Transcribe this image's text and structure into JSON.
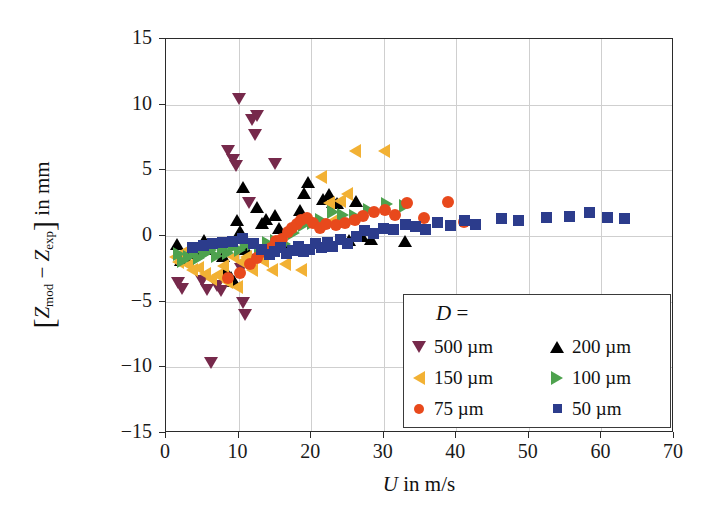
{
  "chart_data": {
    "type": "scatter",
    "title": "",
    "xlabel": "U in m/s",
    "ylabel": "[Z_mod - Z_exp] in mm",
    "xlim": [
      0,
      70
    ],
    "ylim": [
      -15,
      15
    ],
    "xticks": [
      0,
      10,
      20,
      30,
      40,
      50,
      60,
      70
    ],
    "yticks": [
      -15,
      -10,
      -5,
      0,
      5,
      10,
      15
    ],
    "grid": true,
    "legend_position": "lower-right",
    "legend_title": "D =",
    "series": [
      {
        "name": "500 um",
        "label": "500 µm",
        "marker": "triangle-down",
        "color": "#76294B",
        "points": [
          [
            1.6,
            -3.6
          ],
          [
            2.2,
            -4.0
          ],
          [
            5.0,
            -3.4
          ],
          [
            5.6,
            -4.1
          ],
          [
            6.2,
            -9.7
          ],
          [
            7.0,
            -3.8
          ],
          [
            7.6,
            -4.2
          ],
          [
            8.6,
            6.5
          ],
          [
            9.2,
            5.8
          ],
          [
            9.6,
            5.3
          ],
          [
            10.0,
            10.4
          ],
          [
            10.4,
            -2.5
          ],
          [
            10.6,
            -5.1
          ],
          [
            10.9,
            -6.0
          ],
          [
            11.4,
            2.5
          ],
          [
            11.8,
            8.8
          ],
          [
            12.6,
            9.1
          ],
          [
            12.2,
            7.7
          ],
          [
            15.0,
            5.5
          ]
        ]
      },
      {
        "name": "200 um",
        "label": "200 µm",
        "marker": "triangle-up",
        "color": "#000000",
        "points": [
          [
            1.5,
            -0.6
          ],
          [
            2.0,
            -1.8
          ],
          [
            2.6,
            -1.5
          ],
          [
            3.0,
            -1.3
          ],
          [
            4.2,
            -1.2
          ],
          [
            5.2,
            -0.3
          ],
          [
            5.6,
            -1.0
          ],
          [
            7.8,
            -1.5
          ],
          [
            8.2,
            -2.7
          ],
          [
            9.0,
            -3.1
          ],
          [
            9.4,
            -3.4
          ],
          [
            9.8,
            1.2
          ],
          [
            10.2,
            0.4
          ],
          [
            10.6,
            3.7
          ],
          [
            11.0,
            -1.0
          ],
          [
            12.6,
            2.2
          ],
          [
            13.2,
            1.0
          ],
          [
            13.8,
            1.3
          ],
          [
            15.0,
            1.6
          ],
          [
            15.6,
            0.6
          ],
          [
            16.2,
            -0.6
          ],
          [
            18.4,
            2.0
          ],
          [
            19.0,
            3.3
          ],
          [
            19.6,
            4.1
          ],
          [
            21.6,
            2.8
          ],
          [
            22.4,
            3.2
          ],
          [
            23.0,
            2.6
          ],
          [
            23.6,
            2.5
          ],
          [
            25.2,
            -0.3
          ],
          [
            26.2,
            2.7
          ],
          [
            27.0,
            0.0
          ],
          [
            28.2,
            -0.2
          ],
          [
            33.0,
            -0.4
          ]
        ]
      },
      {
        "name": "150 um",
        "label": "150 µm",
        "marker": "triangle-left",
        "color": "#F2B134",
        "points": [
          [
            1.2,
            -1.6
          ],
          [
            1.6,
            -2.0
          ],
          [
            2.2,
            -1.3
          ],
          [
            3.0,
            -2.2
          ],
          [
            3.6,
            -2.6
          ],
          [
            4.4,
            -2.4
          ],
          [
            5.4,
            -2.9
          ],
          [
            6.2,
            -3.3
          ],
          [
            7.0,
            -3.0
          ],
          [
            7.8,
            -2.3
          ],
          [
            8.4,
            -3.5
          ],
          [
            9.2,
            -1.6
          ],
          [
            9.8,
            -3.9
          ],
          [
            10.4,
            -2.0
          ],
          [
            11.0,
            -1.6
          ],
          [
            11.8,
            -2.6
          ],
          [
            12.6,
            -1.5
          ],
          [
            13.4,
            -1.9
          ],
          [
            14.6,
            -2.6
          ],
          [
            16.4,
            -2.1
          ],
          [
            18.6,
            -2.6
          ],
          [
            21.4,
            4.5
          ],
          [
            22.4,
            2.5
          ],
          [
            23.2,
            1.2
          ],
          [
            24.0,
            2.7
          ],
          [
            25.0,
            3.2
          ],
          [
            26.0,
            6.5
          ],
          [
            30.0,
            6.5
          ]
        ]
      },
      {
        "name": "100 um",
        "label": "100 µm",
        "marker": "triangle-right",
        "color": "#4EA24E",
        "points": [
          [
            1.8,
            -1.4
          ],
          [
            2.4,
            -1.9
          ],
          [
            3.2,
            -1.6
          ],
          [
            4.0,
            -1.2
          ],
          [
            4.6,
            -1.7
          ],
          [
            5.4,
            -1.4
          ],
          [
            6.2,
            -1.1
          ],
          [
            7.0,
            -1.5
          ],
          [
            7.8,
            -1.0
          ],
          [
            8.6,
            -1.3
          ],
          [
            9.4,
            -0.8
          ],
          [
            10.2,
            -1.1
          ],
          [
            11.0,
            -0.7
          ],
          [
            12.0,
            -0.6
          ],
          [
            13.0,
            -0.9
          ],
          [
            14.0,
            -0.5
          ],
          [
            15.2,
            -0.4
          ],
          [
            16.4,
            -0.6
          ],
          [
            17.6,
            0.2
          ],
          [
            19.0,
            0.8
          ],
          [
            20.2,
            1.0
          ],
          [
            21.4,
            1.2
          ],
          [
            23.0,
            1.8
          ],
          [
            24.4,
            1.6
          ],
          [
            26.0,
            1.5
          ],
          [
            28.0,
            2.0
          ],
          [
            30.4,
            2.4
          ],
          [
            33.0,
            2.3
          ]
        ]
      },
      {
        "name": "75 um",
        "label": "75 µm",
        "marker": "circle",
        "color": "#E8491C",
        "points": [
          [
            8.6,
            -3.2
          ],
          [
            10.2,
            -2.8
          ],
          [
            11.6,
            -2.1
          ],
          [
            12.6,
            -1.7
          ],
          [
            13.6,
            -1.2
          ],
          [
            14.4,
            -0.9
          ],
          [
            15.2,
            -0.4
          ],
          [
            16.0,
            -0.2
          ],
          [
            16.8,
            0.3
          ],
          [
            17.4,
            0.6
          ],
          [
            18.0,
            0.9
          ],
          [
            18.6,
            1.2
          ],
          [
            19.4,
            1.4
          ],
          [
            20.2,
            1.0
          ],
          [
            21.2,
            0.6
          ],
          [
            22.0,
            0.9
          ],
          [
            23.4,
            0.8
          ],
          [
            24.6,
            1.0
          ],
          [
            26.0,
            1.2
          ],
          [
            27.2,
            1.5
          ],
          [
            28.6,
            1.8
          ],
          [
            30.2,
            2.0
          ],
          [
            31.6,
            1.6
          ],
          [
            33.2,
            2.5
          ],
          [
            35.6,
            1.4
          ],
          [
            38.8,
            2.6
          ],
          [
            41.0,
            1.1
          ]
        ]
      },
      {
        "name": "50 um",
        "label": "50 µm",
        "marker": "square",
        "color": "#2C3C8C",
        "points": [
          [
            3.6,
            -0.9
          ],
          [
            5.2,
            -0.7
          ],
          [
            6.4,
            -0.6
          ],
          [
            7.8,
            -0.5
          ],
          [
            9.2,
            -0.4
          ],
          [
            10.6,
            -0.2
          ],
          [
            12.0,
            -0.6
          ],
          [
            13.2,
            -1.0
          ],
          [
            14.2,
            -1.4
          ],
          [
            15.0,
            -1.2
          ],
          [
            15.8,
            -0.9
          ],
          [
            16.6,
            -1.3
          ],
          [
            17.4,
            -1.1
          ],
          [
            18.2,
            -0.8
          ],
          [
            19.0,
            -1.2
          ],
          [
            19.8,
            -1.0
          ],
          [
            20.6,
            -0.6
          ],
          [
            21.4,
            -0.9
          ],
          [
            22.2,
            -0.5
          ],
          [
            23.0,
            -0.8
          ],
          [
            24.0,
            -0.3
          ],
          [
            25.0,
            -0.6
          ],
          [
            26.2,
            0.0
          ],
          [
            27.4,
            0.4
          ],
          [
            28.6,
            0.2
          ],
          [
            30.0,
            0.6
          ],
          [
            31.4,
            0.5
          ],
          [
            33.0,
            0.9
          ],
          [
            34.4,
            0.7
          ],
          [
            35.8,
            0.5
          ],
          [
            37.4,
            1.0
          ],
          [
            39.2,
            0.8
          ],
          [
            41.2,
            1.2
          ],
          [
            42.6,
            0.9
          ],
          [
            46.2,
            1.3
          ],
          [
            48.6,
            1.2
          ],
          [
            52.4,
            1.4
          ],
          [
            55.6,
            1.5
          ],
          [
            58.4,
            1.8
          ],
          [
            60.8,
            1.4
          ],
          [
            63.2,
            1.3
          ]
        ]
      }
    ]
  },
  "axes": {
    "x_title_var": "U",
    "x_title_rest": "in m/s",
    "y_title_num": "Z",
    "y_title_num_sub": "mod",
    "y_title_minus": "−",
    "y_title_den": "Z",
    "y_title_den_sub": "exp",
    "y_title_rest": "in mm",
    "xtick_labels": [
      "0",
      "10",
      "20",
      "30",
      "40",
      "50",
      "60",
      "70"
    ],
    "ytick_labels": [
      "15",
      "10",
      "5",
      "0",
      "−5",
      "−10",
      "−15"
    ]
  },
  "legend": {
    "title_var": "D",
    "title_eq": "=",
    "rows": [
      {
        "left": {
          "label": "500 µm",
          "marker": "triangle-down",
          "color": "#76294B"
        },
        "right": {
          "label": "200 µm",
          "marker": "triangle-up",
          "color": "#000000"
        }
      },
      {
        "left": {
          "label": "150 µm",
          "marker": "triangle-left",
          "color": "#F2B134"
        },
        "right": {
          "label": "100 µm",
          "marker": "triangle-right",
          "color": "#4EA24E"
        }
      },
      {
        "left": {
          "label": "75 µm",
          "marker": "circle",
          "color": "#E8491C"
        },
        "right": {
          "label": "50 µm",
          "marker": "square",
          "color": "#2C3C8C"
        }
      }
    ]
  },
  "colors": {
    "grid": "#cfcfcf",
    "frame": "#2b2b2b",
    "background": "#ffffff"
  }
}
